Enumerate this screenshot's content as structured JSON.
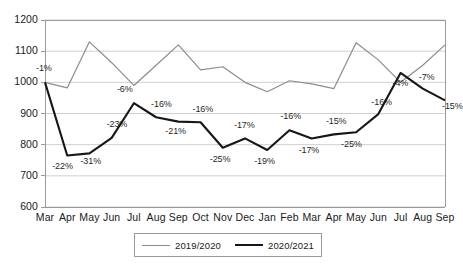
{
  "chart_data": {
    "type": "line",
    "title": "",
    "subtitle": "",
    "xlabel": "",
    "ylabel": "",
    "ylim": [
      600,
      1200
    ],
    "y_ticks": [
      600,
      700,
      800,
      900,
      1000,
      1100,
      1200
    ],
    "grid": true,
    "legend_position": "bottom",
    "categories": [
      "Mar",
      "Apr",
      "May",
      "Jun",
      "Jul",
      "Aug",
      "Sep",
      "Oct",
      "Nov",
      "Dec",
      "Jan",
      "Feb",
      "Mar",
      "Apr",
      "May",
      "Jun",
      "Jul",
      "Aug",
      "Sep"
    ],
    "series": [
      {
        "name": "2019/2020",
        "style": "thin-gray",
        "color": "#8c8c8c",
        "values": [
          1000,
          982,
          1130,
          1063,
          990,
          1055,
          1120,
          1040,
          1050,
          1000,
          970,
          1005,
          995,
          980,
          1127,
          1072,
          1000,
          1055,
          1120
        ]
      },
      {
        "name": "2020/2021",
        "style": "thick-black",
        "color": "#161616",
        "values": [
          1000,
          765,
          772,
          822,
          933,
          888,
          874,
          872,
          790,
          820,
          783,
          846,
          820,
          833,
          840,
          898,
          1030,
          980,
          942
        ],
        "point_labels": [
          "-1%",
          "-22%",
          "-31%",
          "-23%",
          "-6%",
          "-16%",
          "-21%",
          "-16%",
          "-25%",
          "-17%",
          "-19%",
          "-16%",
          "-17%",
          "-15%",
          "-25%",
          "-16%",
          "-4%",
          "-7%",
          "-15%"
        ]
      }
    ]
  },
  "legend": {
    "items": [
      {
        "label": "2019/2020"
      },
      {
        "label": "2020/2021"
      }
    ]
  },
  "colors": {
    "series_old": "#8c8c8c",
    "series_new": "#161616",
    "grid": "#cfcfcf",
    "axis": "#9a9a9a",
    "text": "#1a1a1a"
  }
}
